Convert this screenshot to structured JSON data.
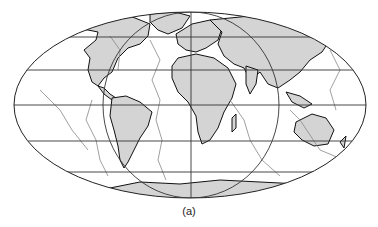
{
  "figure": {
    "caption": "(a)",
    "projection": "Mollweide (elliptical world map)",
    "colors": {
      "ocean": "#ffffff",
      "land": "#d4d4d4",
      "coastline": "#111111",
      "graticule": "#333333",
      "plate_boundaries": "#777777"
    },
    "graticule": {
      "parallels_count": 5,
      "central_meridian": true,
      "inner_meridian_ellipse": true
    },
    "regions": [
      "North America",
      "South America",
      "Europe",
      "Africa",
      "Asia",
      "Australia",
      "Antarctica",
      "Greenland"
    ]
  }
}
